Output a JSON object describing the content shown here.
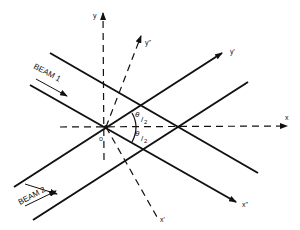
{
  "diagram": {
    "type": "crossing-beams-coordinate-diagram",
    "colors": {
      "ink": "#111111",
      "background": "#ffffff"
    },
    "labels": {
      "beam1": "BEAM 1",
      "beam2": "BEAM 2",
      "origin": "o",
      "x_axis": "x",
      "y_axis": "y",
      "x_prime": "x'",
      "y_prime": "y'",
      "x_double_prime": "x''",
      "y_double_prime": "y''",
      "half_angle_upper_num": "θ",
      "half_angle_upper_den": "2",
      "half_angle_lower_num": "θ",
      "half_angle_lower_den": "2"
    }
  }
}
